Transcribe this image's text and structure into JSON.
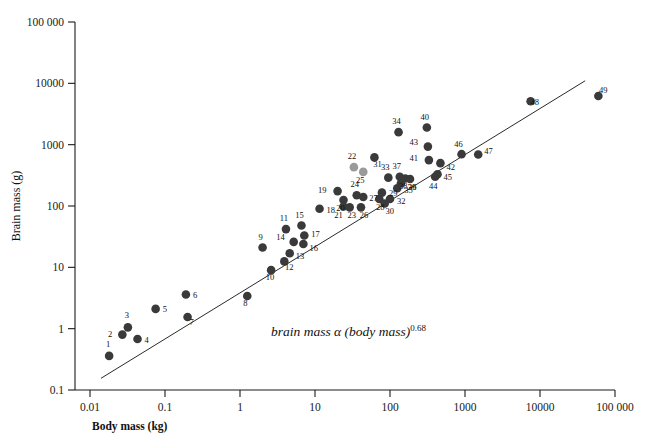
{
  "chart_data": {
    "type": "scatter",
    "title": "",
    "xlabel": "Body mass (kg)",
    "ylabel": "Brain mass (g)",
    "xscale": "log",
    "yscale": "log",
    "xlim": [
      0.01,
      100000
    ],
    "ylim": [
      0.1,
      100000
    ],
    "grid": false,
    "legend": "none",
    "xticks": [
      "0.01",
      "0.1",
      "1",
      "10",
      "100",
      "1000",
      "10000",
      "100 000"
    ],
    "xtick_values": [
      0.01,
      0.1,
      1,
      10,
      100,
      1000,
      10000,
      100000
    ],
    "yticks": [
      "0.1",
      "1",
      "10",
      "100",
      "1000",
      "10000",
      "100 000"
    ],
    "ytick_values": [
      0.1,
      1,
      10,
      100,
      1000,
      10000,
      100000
    ],
    "annotation": {
      "text_italic": "brain mass α (body mass)",
      "text_exponent": "0.68",
      "x": 2.6,
      "y": 0.75
    },
    "trendline": {
      "label": "brain mass α (body mass)^0.68",
      "exponent": 0.68,
      "x_start": 0.014,
      "y_start": 0.155,
      "x_end": 40000,
      "y_end": 11000
    },
    "marker_color_primary": "#3a3a3a",
    "marker_color_secondary": "#9a9a9a",
    "points": [
      {
        "id": "1",
        "x": 0.018,
        "y": 0.36,
        "color": "primary",
        "lx": -1,
        "ly": -9
      },
      {
        "id": "2",
        "x": 0.027,
        "y": 0.8,
        "color": "primary",
        "lx": -10,
        "ly": 2
      },
      {
        "id": "3",
        "x": 0.032,
        "y": 1.05,
        "color": "primary",
        "lx": -1,
        "ly": -9
      },
      {
        "id": "4",
        "x": 0.043,
        "y": 0.68,
        "color": "primary",
        "lx": 7,
        "ly": 4
      },
      {
        "id": "5",
        "x": 0.075,
        "y": 2.1,
        "color": "primary",
        "lx": 7,
        "ly": 3
      },
      {
        "id": "6",
        "x": 0.19,
        "y": 3.6,
        "color": "primary",
        "lx": 7,
        "ly": 3
      },
      {
        "id": "7",
        "x": 0.2,
        "y": 1.55,
        "color": "primary",
        "lx": 4,
        "ly": 8
      },
      {
        "id": "8",
        "x": 1.25,
        "y": 3.4,
        "color": "primary",
        "lx": -2,
        "ly": 10
      },
      {
        "id": "9",
        "x": 2.0,
        "y": 21,
        "color": "primary",
        "lx": -2,
        "ly": -8
      },
      {
        "id": "10",
        "x": 2.6,
        "y": 9.0,
        "color": "primary",
        "lx": -1,
        "ly": 10
      },
      {
        "id": "11",
        "x": 4.1,
        "y": 42,
        "color": "primary",
        "lx": -2,
        "ly": -8
      },
      {
        "id": "12",
        "x": 3.9,
        "y": 12.5,
        "color": "primary",
        "lx": 5,
        "ly": 9
      },
      {
        "id": "13",
        "x": 4.6,
        "y": 17,
        "color": "primary",
        "lx": 6,
        "ly": 6
      },
      {
        "id": "14",
        "x": 5.2,
        "y": 26,
        "color": "primary",
        "lx": -9,
        "ly": -2
      },
      {
        "id": "15",
        "x": 6.6,
        "y": 48,
        "color": "primary",
        "lx": -2,
        "ly": -8
      },
      {
        "id": "16",
        "x": 7.0,
        "y": 24,
        "color": "primary",
        "lx": 6,
        "ly": 7
      },
      {
        "id": "17",
        "x": 7.2,
        "y": 33,
        "color": "primary",
        "lx": 7,
        "ly": 1
      },
      {
        "id": "18",
        "x": 11.5,
        "y": 90,
        "color": "primary",
        "lx": 7,
        "ly": 4
      },
      {
        "id": "19",
        "x": 20,
        "y": 175,
        "color": "primary",
        "lx": -11,
        "ly": 2
      },
      {
        "id": "20",
        "x": 24,
        "y": 125,
        "color": "primary",
        "lx": -3,
        "ly": 11
      },
      {
        "id": "21",
        "x": 24,
        "y": 98,
        "color": "primary",
        "lx": -5,
        "ly": 11
      },
      {
        "id": "22",
        "x": 33,
        "y": 430,
        "color": "secondary",
        "lx": -2,
        "ly": -8
      },
      {
        "id": "23",
        "x": 29,
        "y": 95,
        "color": "primary",
        "lx": 2,
        "ly": 11
      },
      {
        "id": "24",
        "x": 36,
        "y": 150,
        "color": "primary",
        "lx": -2,
        "ly": -8
      },
      {
        "id": "25",
        "x": 44,
        "y": 360,
        "color": "secondary",
        "lx": -3,
        "ly": 11
      },
      {
        "id": "26",
        "x": 41,
        "y": 95,
        "color": "primary",
        "lx": 3,
        "ly": 11
      },
      {
        "id": "27",
        "x": 44,
        "y": 140,
        "color": "primary",
        "lx": 6,
        "ly": 4
      },
      {
        "id": "28",
        "x": 72,
        "y": 130,
        "color": "primary",
        "lx": 1,
        "ly": 11
      },
      {
        "id": "29",
        "x": 78,
        "y": 165,
        "color": "primary",
        "lx": 7,
        "ly": 3
      },
      {
        "id": "30",
        "x": 85,
        "y": 110,
        "color": "primary",
        "lx": 5,
        "ly": 11
      },
      {
        "id": "31",
        "x": 62,
        "y": 620,
        "color": "primary",
        "lx": 3,
        "ly": 10
      },
      {
        "id": "32",
        "x": 100,
        "y": 130,
        "color": "primary",
        "lx": 7,
        "ly": 5
      },
      {
        "id": "33",
        "x": 95,
        "y": 290,
        "color": "primary",
        "lx": -3,
        "ly": -8
      },
      {
        "id": "34",
        "x": 130,
        "y": 1600,
        "color": "primary",
        "lx": -2,
        "ly": -8
      },
      {
        "id": "35",
        "x": 125,
        "y": 195,
        "color": "primary",
        "lx": 7,
        "ly": 5
      },
      {
        "id": "36",
        "x": 140,
        "y": 235,
        "color": "primary",
        "lx": 7,
        "ly": 7
      },
      {
        "id": "37",
        "x": 135,
        "y": 300,
        "color": "primary",
        "lx": -3,
        "ly": -8
      },
      {
        "id": "38",
        "x": 160,
        "y": 280,
        "color": "primary",
        "lx": -2,
        "ly": 10
      },
      {
        "id": "39",
        "x": 185,
        "y": 275,
        "color": "primary",
        "lx": 2,
        "ly": 11
      },
      {
        "id": "40",
        "x": 310,
        "y": 1900,
        "color": "primary",
        "lx": -2,
        "ly": -8
      },
      {
        "id": "41",
        "x": 330,
        "y": 560,
        "color": "primary",
        "lx": -11,
        "ly": 1
      },
      {
        "id": "42",
        "x": 470,
        "y": 500,
        "color": "primary",
        "lx": 6,
        "ly": 7
      },
      {
        "id": "43",
        "x": 320,
        "y": 930,
        "color": "primary",
        "lx": -10,
        "ly": -2
      },
      {
        "id": "44",
        "x": 400,
        "y": 300,
        "color": "primary",
        "lx": -2,
        "ly": 12
      },
      {
        "id": "45",
        "x": 430,
        "y": 330,
        "color": "primary",
        "lx": 6,
        "ly": 6
      },
      {
        "id": "46",
        "x": 900,
        "y": 700,
        "color": "primary",
        "lx": -3,
        "ly": -7
      },
      {
        "id": "47",
        "x": 1500,
        "y": 690,
        "color": "primary",
        "lx": 6,
        "ly": -1
      },
      {
        "id": "48",
        "x": 7500,
        "y": 5100,
        "color": "primary",
        "lx": 4,
        "ly": 4
      },
      {
        "id": "49",
        "x": 60000,
        "y": 6200,
        "color": "primary",
        "lx": 5,
        "ly": -3
      }
    ]
  }
}
